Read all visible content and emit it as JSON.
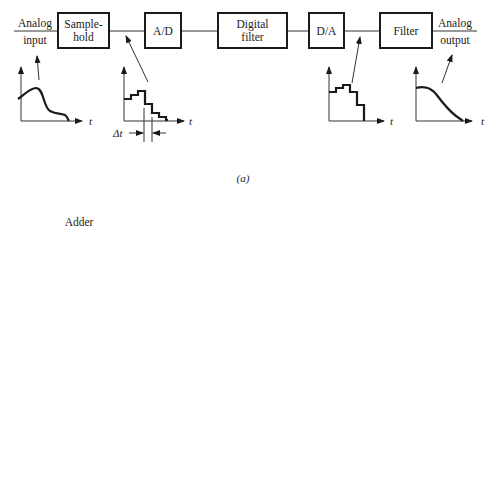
{
  "part_a": {
    "caption": "(a)",
    "input_label": [
      "Analog",
      "input"
    ],
    "output_label": [
      "Analog",
      "output"
    ],
    "blocks": [
      {
        "id": "sample-hold",
        "lines": [
          "Sample-",
          "hold"
        ]
      },
      {
        "id": "ad",
        "lines": [
          "A/D"
        ]
      },
      {
        "id": "digital-filter",
        "lines": [
          "Digital",
          "filter"
        ]
      },
      {
        "id": "da",
        "lines": [
          "D/A"
        ]
      },
      {
        "id": "filter",
        "lines": [
          "Filter"
        ]
      }
    ],
    "waveforms": [
      {
        "id": "analog-input-wave",
        "axis_label": "t"
      },
      {
        "id": "sampled-wave",
        "axis_label": "t",
        "interval_label": "Δt"
      },
      {
        "id": "da-output-wave",
        "axis_label": "t"
      },
      {
        "id": "analog-output-wave",
        "axis_label": "t"
      }
    ]
  },
  "part_b": {
    "caption": "(b)",
    "adder": {
      "title": "Adder",
      "input1": "x",
      "input1_sub": "1",
      "input2": "x",
      "input2_sub": "2",
      "output": "y",
      "sign1": "+",
      "sign2": "+",
      "symbol": "+",
      "equation": "y = x₁ + x₂"
    },
    "subtractor": {
      "title": "Subtractor",
      "input1": "x",
      "input1_sub": "1",
      "input2": "x",
      "input2_sub": "2",
      "output": "y",
      "sign1": "+",
      "sign2": "−",
      "symbol": "+",
      "equation": "y = x₁ − x₂"
    },
    "scaler": {
      "title": "Scaler",
      "input": "x",
      "gain": "K",
      "output": "y = Kx"
    },
    "delay": {
      "input": "x(n Δt)",
      "output": "x[(n − 1) Δt]",
      "label_lines": [
        "Delay",
        "Δt"
      ]
    },
    "pulse_plots": [
      {
        "id": "current-sample-plot",
        "label": "x(n Δt)",
        "axis_label": "t"
      },
      {
        "id": "delayed-sample-plot",
        "label": "x[(n − 1) Δt]",
        "axis_label": "t"
      }
    ]
  }
}
